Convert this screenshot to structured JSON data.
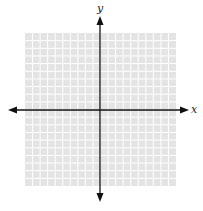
{
  "chart_data": {
    "type": "coordinate-grid",
    "title": "",
    "xlabel": "x",
    "ylabel": "y",
    "xlim": [
      -10,
      10
    ],
    "ylim": [
      -10,
      10
    ],
    "grid": true,
    "grid_cells": {
      "columns": 20,
      "rows": 20
    },
    "data": [],
    "arrows": {
      "x_axis": "both-ends",
      "y_axis": "both-ends"
    }
  },
  "labels": {
    "x_axis": "x",
    "y_axis": "y"
  },
  "colors": {
    "grid_fill": "#e4e4e4",
    "grid_line": "#ffffff",
    "axis": "#111111",
    "background": "#ffffff"
  },
  "layout": {
    "grid_left": 25,
    "grid_top": 33,
    "grid_right": 176,
    "grid_bottom": 186,
    "origin_x": 100,
    "origin_y": 110
  }
}
